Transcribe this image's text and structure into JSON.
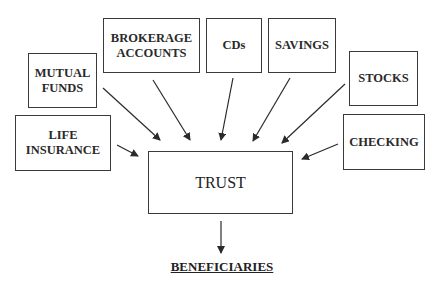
{
  "diagram": {
    "sources": [
      {
        "id": "mutual-funds",
        "label": "MUTUAL\nFUNDS"
      },
      {
        "id": "brokerage-accounts",
        "label": "BROKERAGE\nACCOUNTS"
      },
      {
        "id": "cds",
        "label": "CDs"
      },
      {
        "id": "savings",
        "label": "SAVINGS"
      },
      {
        "id": "stocks",
        "label": "STOCKS"
      },
      {
        "id": "life-insurance",
        "label": "LIFE\nINSURANCE"
      },
      {
        "id": "checking",
        "label": "CHECKING"
      }
    ],
    "center": {
      "label": "TRUST"
    },
    "target": {
      "label": "BENEFICIARIES"
    },
    "edges": [
      {
        "from": "mutual-funds",
        "to": "trust"
      },
      {
        "from": "brokerage-accounts",
        "to": "trust"
      },
      {
        "from": "cds",
        "to": "trust"
      },
      {
        "from": "savings",
        "to": "trust"
      },
      {
        "from": "stocks",
        "to": "trust"
      },
      {
        "from": "life-insurance",
        "to": "trust"
      },
      {
        "from": "checking",
        "to": "trust"
      },
      {
        "from": "trust",
        "to": "beneficiaries"
      }
    ]
  }
}
